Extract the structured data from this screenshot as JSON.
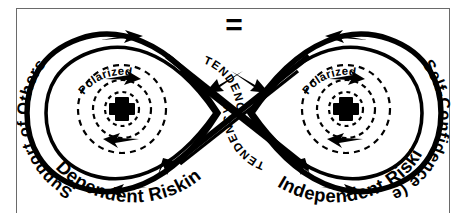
{
  "figure": {
    "type": "lemniscate-infinity-diagram",
    "frame": {
      "border_color": "#6a6a6a",
      "background": "#ffffff"
    },
    "center_symbol": "=",
    "stroke_color": "#000000",
    "lobes": [
      {
        "side": "left",
        "outer_label": "Support of Others",
        "bottom_label": "Dependent Risking",
        "inner_arc_label": "TENDENCY",
        "core_label": "Polarized",
        "core_symbol": "+"
      },
      {
        "side": "right",
        "outer_label": "Self-Confidence (ego)",
        "bottom_label": "Independent Risking",
        "inner_arc_label": "TENDENCY",
        "core_label": "Polarized",
        "core_symbol": "+"
      }
    ]
  }
}
